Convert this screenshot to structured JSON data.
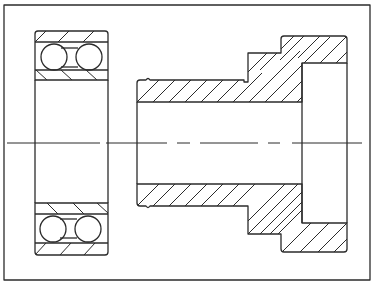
{
  "drawing": {
    "title": "Bearing and stepped sleeve cross-section",
    "type": "technical-section-drawing",
    "colors": {
      "line": "#2b2b2b",
      "background": "#ffffff"
    },
    "frame": {
      "x": 4,
      "y": 5,
      "width": 366,
      "height": 275
    },
    "centerline": {
      "y": 143,
      "segments": [
        [
          7,
          100
        ],
        [
          106,
          167
        ],
        [
          177,
          190
        ],
        [
          200,
          258
        ],
        [
          268,
          280
        ],
        [
          292,
          362
        ]
      ]
    },
    "parts": [
      {
        "name": "double-row-ball-bearing",
        "x": 35,
        "width": 73,
        "top_block": [
          31,
          80
        ],
        "bottom_block": [
          203,
          255
        ],
        "balls_per_row": 2
      },
      {
        "name": "stepped-sleeve",
        "bore_start_x": 137,
        "flange_right_x": 347,
        "top_y": 36,
        "bottom_y": 252
      }
    ]
  }
}
